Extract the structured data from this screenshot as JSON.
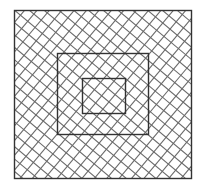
{
  "figure": {
    "background": "#ffffff",
    "stroke_color": "#333333",
    "hatch_color": "#6a6a6a",
    "hatch_spacing": 9.5,
    "hatch_angle_a": 40,
    "hatch_angle_b": -50,
    "squares": [
      {
        "name": "outer-square",
        "x": 14,
        "y": 10,
        "width": 177,
        "height": 168
      },
      {
        "name": "middle-square",
        "x": 57,
        "y": 53,
        "width": 91,
        "height": 81
      },
      {
        "name": "inner-square",
        "x": 82,
        "y": 78,
        "width": 43,
        "height": 35
      }
    ]
  }
}
